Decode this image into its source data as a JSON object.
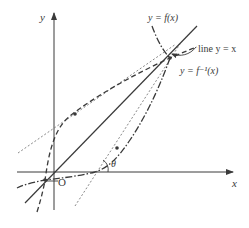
{
  "figure": {
    "type": "function-and-inverse-diagram",
    "colors": {
      "background": "#ffffff",
      "stroke": "#3a3a3a",
      "tangent": "#6a6a6a"
    },
    "axes": {
      "x_label": "x",
      "y_label": "y",
      "origin_label": "O"
    },
    "curves": {
      "f": {
        "label": "y = f(x)",
        "style": "dash-dot"
      },
      "f_inverse": {
        "label": "y = f⁻¹(x)",
        "style": "dashed"
      },
      "identity": {
        "label": "line y = x",
        "style": "solid"
      }
    },
    "tangents": {
      "style": "dotted",
      "count": 2
    },
    "angle_label": "θ"
  }
}
